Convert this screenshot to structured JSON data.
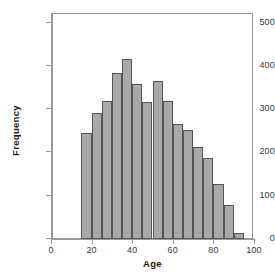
{
  "chart_data": {
    "type": "bar",
    "title": "",
    "subtitle": "",
    "xlabel": "Age",
    "ylabel": "Frequency",
    "xlim": [
      0,
      100
    ],
    "ylim": [
      0,
      520
    ],
    "grid": false,
    "legend": null,
    "bin_width": 5,
    "xticks": [
      0,
      20,
      40,
      60,
      80,
      100
    ],
    "xtick_labels": [
      "0",
      "20",
      "40",
      "60",
      "80",
      "100"
    ],
    "yticks": [
      0,
      100,
      200,
      300,
      400,
      500
    ],
    "ytick_labels": [
      "0",
      "100",
      "200",
      "300",
      "400",
      "500"
    ],
    "bin_starts": [
      15,
      20,
      25,
      30,
      35,
      40,
      45,
      50,
      55,
      60,
      65,
      70,
      75,
      80,
      85,
      90
    ],
    "bin_ends": [
      20,
      25,
      30,
      35,
      40,
      45,
      50,
      55,
      60,
      65,
      70,
      75,
      80,
      85,
      90,
      95
    ],
    "categories": [
      "15-20",
      "20-25",
      "25-30",
      "30-35",
      "35-40",
      "40-45",
      "45-50",
      "50-55",
      "55-60",
      "60-65",
      "65-70",
      "70-75",
      "75-80",
      "80-85",
      "85-90",
      "90-95"
    ],
    "values": [
      243,
      290,
      318,
      383,
      416,
      357,
      316,
      364,
      317,
      265,
      250,
      211,
      185,
      126,
      77,
      13
    ],
    "bar_fill_color": "#a9a9a9",
    "bar_edge_color": "#555555",
    "axis_color": "#9a9a9a",
    "text_color": "#3a3a3a",
    "background_color": "#ffffff"
  }
}
